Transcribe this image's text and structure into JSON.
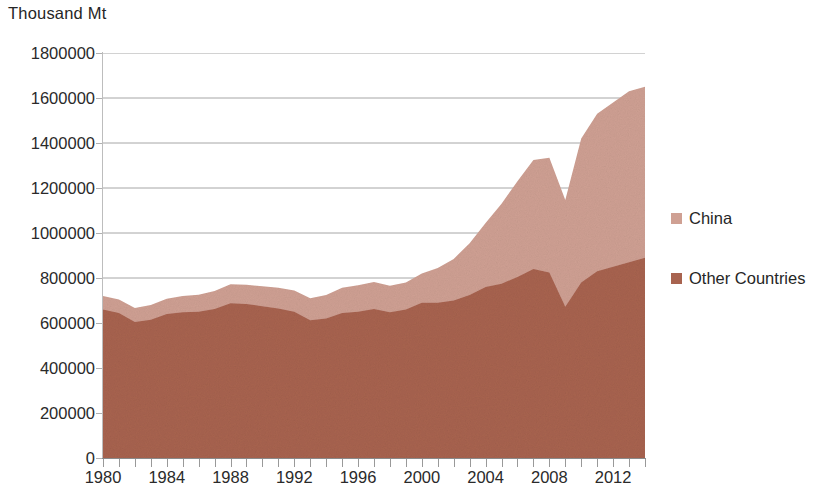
{
  "chart_data": {
    "type": "area",
    "stacked": true,
    "title": "",
    "ylabel": "Thousand Mt",
    "xlabel": "",
    "ylim": [
      0,
      1800000
    ],
    "y_ticks": [
      0,
      200000,
      400000,
      600000,
      800000,
      1000000,
      1200000,
      1400000,
      1600000,
      1800000
    ],
    "y_tick_labels": [
      "0",
      "200000",
      "400000",
      "600000",
      "800000",
      "1000000",
      "1200000",
      "1400000",
      "1600000",
      "1800000"
    ],
    "xlim": [
      1980,
      2014
    ],
    "x_tick_labels": [
      "1980",
      "1984",
      "1988",
      "1992",
      "1996",
      "2000",
      "2004",
      "2008",
      "2012"
    ],
    "x_tick_values": [
      1980,
      1984,
      1988,
      1992,
      1996,
      2000,
      2004,
      2008,
      2012
    ],
    "x_minor_tick_interval": 1,
    "grid": "horizontal",
    "grid_color": "#a6a6a6",
    "legend_position": "right",
    "x": [
      1980,
      1981,
      1982,
      1983,
      1984,
      1985,
      1986,
      1987,
      1988,
      1989,
      1990,
      1991,
      1992,
      1993,
      1994,
      1995,
      1996,
      1997,
      1998,
      1999,
      2000,
      2001,
      2002,
      2003,
      2004,
      2005,
      2006,
      2007,
      2008,
      2009,
      2010,
      2011,
      2012,
      2013,
      2014
    ],
    "series": [
      {
        "name": "Other Countries",
        "color": "#a8634f",
        "stack_order": 0,
        "values": [
          660000,
          645000,
          605000,
          615000,
          640000,
          648000,
          650000,
          662000,
          688000,
          685000,
          675000,
          665000,
          650000,
          612000,
          620000,
          645000,
          650000,
          662000,
          648000,
          660000,
          690000,
          690000,
          700000,
          725000,
          760000,
          775000,
          805000,
          840000,
          825000,
          672000,
          780000,
          830000,
          850000,
          870000,
          890000
        ]
      },
      {
        "name": "China",
        "color": "#cfa093",
        "stack_order": 1,
        "values": [
          60000,
          60000,
          62000,
          65000,
          68000,
          72000,
          76000,
          80000,
          84000,
          85000,
          88000,
          92000,
          95000,
          98000,
          105000,
          112000,
          118000,
          120000,
          118000,
          120000,
          130000,
          155000,
          185000,
          230000,
          285000,
          355000,
          425000,
          485000,
          510000,
          475000,
          640000,
          700000,
          730000,
          760000,
          760000
        ]
      }
    ],
    "totals": [
      720000,
      705000,
      667000,
      680000,
      708000,
      720000,
      726000,
      742000,
      772000,
      770000,
      763000,
      757000,
      745000,
      710000,
      725000,
      757000,
      768000,
      782000,
      766000,
      780000,
      820000,
      845000,
      885000,
      955000,
      1045000,
      1130000,
      1230000,
      1325000,
      1335000,
      1147000,
      1420000,
      1530000,
      1580000,
      1630000,
      1650000
    ]
  },
  "legend": {
    "entries": [
      {
        "label": "China",
        "color": "#cfa093"
      },
      {
        "label": "Other Countries",
        "color": "#a8634f"
      }
    ]
  },
  "axis": {
    "y_title": "Thousand Mt"
  }
}
